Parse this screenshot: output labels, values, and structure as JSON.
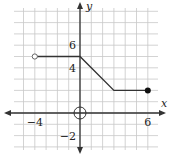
{
  "chart_data": {
    "type": "line",
    "title": "",
    "xlabel": "x",
    "ylabel": "y",
    "xlim": [
      -6,
      7
    ],
    "ylim": [
      -3,
      9
    ],
    "grid": true,
    "grid_step": 1,
    "x_tick_labels": [
      {
        "value": -4,
        "label": "−4"
      },
      {
        "value": 6,
        "label": "6"
      }
    ],
    "y_tick_labels": [
      {
        "value": 6,
        "label": "6"
      },
      {
        "value": 4,
        "label": "4"
      },
      {
        "value": -2,
        "label": "−2"
      }
    ],
    "series": [
      {
        "name": "piecewise function",
        "points": [
          [
            -4,
            5
          ],
          [
            0,
            5
          ],
          [
            3,
            2
          ],
          [
            6,
            2
          ]
        ],
        "color": "#333333"
      }
    ],
    "endpoints": [
      {
        "x": -4,
        "y": 5,
        "type": "open"
      },
      {
        "x": 6,
        "y": 2,
        "type": "closed"
      }
    ],
    "annotations": [
      {
        "type": "circle",
        "x": 0,
        "y": 0,
        "description": "circle at origin"
      }
    ]
  },
  "colors": {
    "grid": "#c8c8c8",
    "axis": "#333333",
    "line": "#333333",
    "background": "#ffffff"
  }
}
